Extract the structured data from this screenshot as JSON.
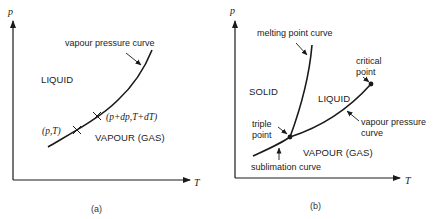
{
  "figure": {
    "panels": [
      {
        "id": "a",
        "caption": "(a)",
        "axes": {
          "y_label": "p",
          "x_label": "T"
        },
        "regions": {
          "liquid": "LIQUID",
          "vapour": "VAPOUR (GAS)"
        },
        "curves": {
          "vapour_pressure": "vapour pressure curve"
        },
        "points": {
          "p1": "(p,T)",
          "p2": "(p+dp,T+dT)"
        }
      },
      {
        "id": "b",
        "caption": "(b)",
        "axes": {
          "y_label": "p",
          "x_label": "T"
        },
        "regions": {
          "solid": "SOLID",
          "liquid": "LIQUID",
          "vapour": "VAPOUR (GAS)"
        },
        "curves": {
          "melting": "melting point curve",
          "vapour_pressure_line1": "vapour pressure",
          "vapour_pressure_line2": "curve",
          "sublimation": "sublimation curve"
        },
        "points": {
          "triple_line1": "triple",
          "triple_line2": "point",
          "critical_line1": "critical",
          "critical_line2": "point"
        }
      }
    ]
  },
  "colors": {
    "ink": "#1a1a1a",
    "background": "#ffffff"
  }
}
